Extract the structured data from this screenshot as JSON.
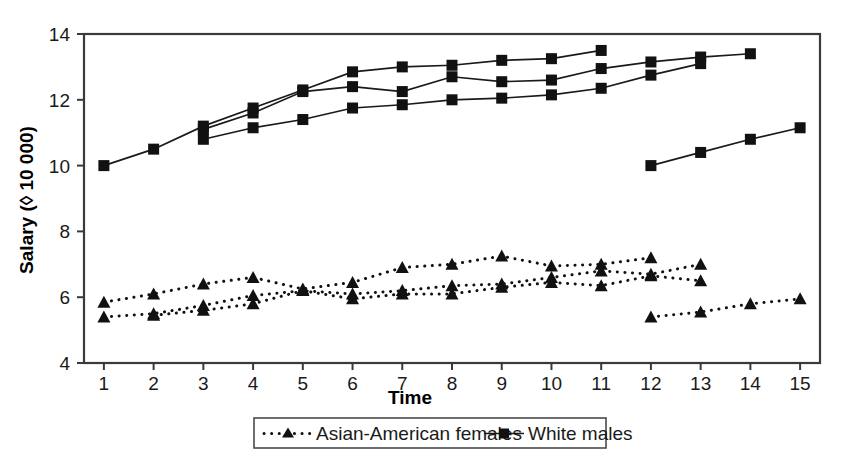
{
  "chart_data": {
    "type": "scatter",
    "title": "",
    "xlabel": "Time",
    "ylabel": "Salary (◊ 10 000)",
    "xlim": [
      0.6,
      15.4
    ],
    "ylim": [
      4,
      14
    ],
    "xticks": [
      "1",
      "2",
      "3",
      "4",
      "5",
      "6",
      "7",
      "8",
      "9",
      "10",
      "11",
      "12",
      "13",
      "14",
      "15"
    ],
    "yticks": [
      "4",
      "6",
      "8",
      "10",
      "12",
      "14"
    ],
    "grid": false,
    "legend_position": "bottom-center",
    "legend": [
      {
        "label": "Asian-American females",
        "marker": "triangle",
        "line": "dotted"
      },
      {
        "label": "White males",
        "marker": "square",
        "line": "solid"
      }
    ],
    "series": [
      {
        "name": "White males",
        "group": "White males",
        "marker": "triangle-up-none",
        "trajectory": "wm-1",
        "x": [
          1,
          2,
          3,
          4,
          5,
          6,
          7,
          8,
          9,
          10,
          11
        ],
        "y": [
          10.0,
          10.5,
          11.2,
          11.75,
          12.3,
          12.85,
          13.0,
          13.05,
          13.2,
          13.25,
          13.5
        ]
      },
      {
        "name": "White males",
        "group": "White males",
        "marker": "square",
        "trajectory": "wm-2",
        "x": [
          3,
          4,
          5,
          6,
          7,
          8,
          9,
          10,
          11,
          12,
          13,
          14
        ],
        "y": [
          11.1,
          11.6,
          12.25,
          12.4,
          12.25,
          12.7,
          12.55,
          12.6,
          12.95,
          13.15,
          13.3,
          13.4
        ]
      },
      {
        "name": "White males",
        "group": "White males",
        "marker": "square",
        "trajectory": "wm-3",
        "x": [
          3,
          4,
          5,
          6,
          7,
          8,
          9,
          10,
          11,
          12,
          13
        ],
        "y": [
          10.8,
          11.15,
          11.4,
          11.75,
          11.85,
          12.0,
          12.05,
          12.15,
          12.35,
          12.75,
          13.1
        ]
      },
      {
        "name": "White males",
        "group": "White males",
        "marker": "square",
        "trajectory": "wm-4",
        "x": [
          12,
          13,
          14,
          15
        ],
        "y": [
          10.0,
          10.4,
          10.8,
          11.15
        ]
      },
      {
        "name": "Asian-American females",
        "group": "Asian-American females",
        "marker": "triangle",
        "trajectory": "af-1",
        "x": [
          1,
          2,
          3,
          4,
          5,
          6,
          7,
          8,
          9,
          10,
          11,
          12
        ],
        "y": [
          5.85,
          6.1,
          6.4,
          6.6,
          6.25,
          6.45,
          6.9,
          7.0,
          7.25,
          6.95,
          7.0,
          7.2
        ]
      },
      {
        "name": "Asian-American females",
        "group": "Asian-American females",
        "marker": "triangle",
        "trajectory": "af-2",
        "x": [
          1,
          2,
          3,
          4,
          5,
          6,
          7,
          8,
          9,
          10,
          11,
          12,
          13
        ],
        "y": [
          5.4,
          5.5,
          5.75,
          6.05,
          6.2,
          6.1,
          6.2,
          6.35,
          6.4,
          6.6,
          6.8,
          6.7,
          7.0
        ]
      },
      {
        "name": "Asian-American females",
        "group": "Asian-American females",
        "marker": "triangle",
        "trajectory": "af-3",
        "x": [
          2,
          3,
          4,
          5,
          6,
          7,
          8,
          9,
          10,
          11,
          12,
          13
        ],
        "y": [
          5.45,
          5.6,
          5.8,
          6.2,
          5.95,
          6.1,
          6.1,
          6.3,
          6.45,
          6.35,
          6.65,
          6.5
        ]
      },
      {
        "name": "Asian-American females",
        "group": "Asian-American females",
        "marker": "triangle",
        "trajectory": "af-4",
        "x": [
          12,
          13,
          14,
          15
        ],
        "y": [
          5.4,
          5.55,
          5.8,
          5.95
        ]
      }
    ]
  },
  "axis": {
    "y_title": "Salary (◊ 10 000)",
    "x_title": "Time",
    "y_tick_labels": [
      "14",
      "12",
      "10",
      "8",
      "6",
      "4"
    ],
    "x_tick_labels": [
      "1",
      "2",
      "3",
      "4",
      "5",
      "6",
      "7",
      "8",
      "9",
      "10",
      "11",
      "12",
      "13",
      "14",
      "15"
    ]
  },
  "legend": {
    "entry_1": "Asian-American females",
    "entry_2": "White males"
  },
  "colors": {
    "ink": "#111111",
    "frame": "#3a3a3a",
    "background": "#ffffff"
  }
}
